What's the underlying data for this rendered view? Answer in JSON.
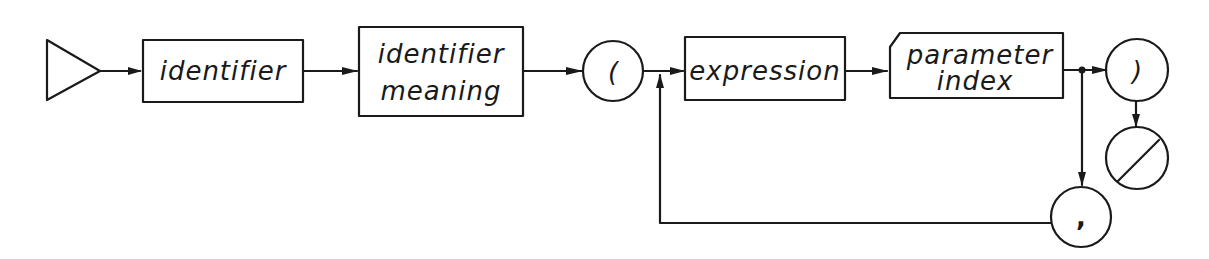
{
  "diagram": {
    "type": "syntax-diagram",
    "nodes": [
      {
        "id": "start",
        "shape": "triangle",
        "label": ""
      },
      {
        "id": "identifier",
        "shape": "rect",
        "label": "identifier"
      },
      {
        "id": "identifier_meaning",
        "shape": "rect",
        "label_line1": "identifier",
        "label_line2": "meaning"
      },
      {
        "id": "lparen",
        "shape": "circle",
        "label": "("
      },
      {
        "id": "expression",
        "shape": "rect",
        "label": "expression"
      },
      {
        "id": "parameter_index",
        "shape": "cut-corner-rect",
        "label_line1": "parameter",
        "label_line2": "index"
      },
      {
        "id": "rparen",
        "shape": "circle",
        "label": ")"
      },
      {
        "id": "end",
        "shape": "circle-slash",
        "label": ""
      },
      {
        "id": "comma",
        "shape": "circle",
        "label": ","
      }
    ],
    "edges": [
      {
        "from": "start",
        "to": "identifier"
      },
      {
        "from": "identifier",
        "to": "identifier_meaning"
      },
      {
        "from": "identifier_meaning",
        "to": "lparen"
      },
      {
        "from": "lparen",
        "to": "expression"
      },
      {
        "from": "expression",
        "to": "parameter_index"
      },
      {
        "from": "parameter_index",
        "to": "rparen"
      },
      {
        "from": "rparen",
        "to": "end"
      },
      {
        "from": "parameter_index",
        "to": "comma"
      },
      {
        "from": "comma",
        "to": "expression",
        "note": "loop back"
      }
    ]
  }
}
